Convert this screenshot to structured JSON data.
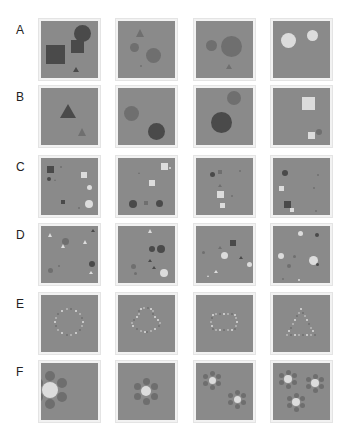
{
  "figure": {
    "rows": [
      {
        "label": "A",
        "top": 21
      },
      {
        "label": "B",
        "top": 88
      },
      {
        "label": "C",
        "top": 158
      },
      {
        "label": "D",
        "top": 226
      },
      {
        "label": "E",
        "top": 295
      },
      {
        "label": "F",
        "top": 363
      }
    ],
    "columns": [
      41,
      118,
      196,
      273
    ],
    "colors": {
      "background": "#8a8a8a",
      "dark": "#4a4a4a",
      "mid": "#6f6f6f",
      "light": "#dcdcdc"
    }
  }
}
